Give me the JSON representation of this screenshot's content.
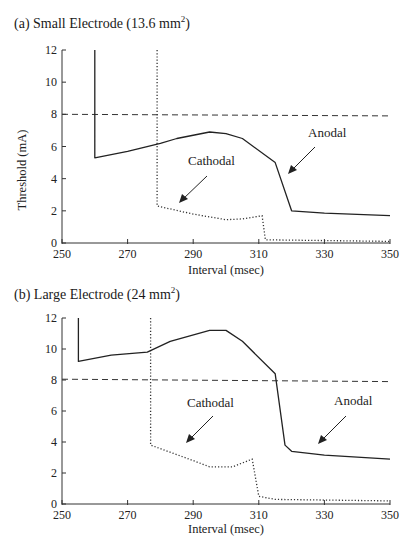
{
  "panels": [
    {
      "id": "a",
      "title_prefix": "(a) Small Electrode (13.6 mm",
      "title_sup": "2",
      "title_suffix": ")",
      "ylabel": "Threshold (mA)",
      "xlabel": "Interval (msec)",
      "x_ticks": [
        "250",
        "270",
        "290",
        "310",
        "330",
        "350"
      ],
      "y_ticks": [
        "0",
        "2",
        "4",
        "6",
        "8",
        "10",
        "12"
      ],
      "annotations": {
        "cathodal": "Cathodal",
        "anodal": "Anodal"
      }
    },
    {
      "id": "b",
      "title_prefix": "(b) Large Electrode (24 mm",
      "title_sup": "2",
      "title_suffix": ")",
      "ylabel": "Threshold (mA)",
      "xlabel": "Interval (msec)",
      "x_ticks": [
        "250",
        "270",
        "290",
        "310",
        "330",
        "350"
      ],
      "y_ticks": [
        "0",
        "2",
        "4",
        "6",
        "8",
        "10",
        "12"
      ],
      "annotations": {
        "cathodal": "Cathodal",
        "anodal": "Anodal"
      }
    }
  ],
  "chart_data": [
    {
      "type": "line",
      "title": "(a) Small Electrode (13.6 mm²)",
      "xlabel": "Interval (msec)",
      "ylabel": "Threshold (mA)",
      "xlim": [
        250,
        350
      ],
      "ylim": [
        0,
        12
      ],
      "x_ticks": [
        250,
        270,
        290,
        310,
        330,
        350
      ],
      "y_ticks": [
        0,
        2,
        4,
        6,
        8,
        10,
        12
      ],
      "grid": false,
      "legend": "none (inline annotations with arrows)",
      "series": [
        {
          "name": "Anodal",
          "style": "solid",
          "x": [
            260,
            260,
            270,
            280,
            285,
            295,
            300,
            305,
            315,
            320,
            330,
            350
          ],
          "y": [
            12,
            5.3,
            5.7,
            6.2,
            6.5,
            6.9,
            6.8,
            6.5,
            5.0,
            2.0,
            1.85,
            1.7
          ]
        },
        {
          "name": "Cathodal",
          "style": "dotted",
          "x": [
            279,
            279,
            290,
            300,
            305,
            311,
            312,
            350
          ],
          "y": [
            12,
            2.3,
            1.8,
            1.45,
            1.5,
            1.7,
            0.2,
            0.1
          ]
        },
        {
          "name": "Reference (8 mA)",
          "style": "dashed",
          "x": [
            250,
            350
          ],
          "y": [
            8,
            7.9
          ]
        }
      ],
      "annotations": [
        "Cathodal",
        "Anodal"
      ]
    },
    {
      "type": "line",
      "title": "(b) Large Electrode (24 mm²)",
      "xlabel": "Interval (msec)",
      "ylabel": "",
      "xlim": [
        250,
        350
      ],
      "ylim": [
        0,
        12
      ],
      "x_ticks": [
        250,
        270,
        290,
        310,
        330,
        350
      ],
      "y_ticks": [
        0,
        2,
        4,
        6,
        8,
        10,
        12
      ],
      "grid": false,
      "legend": "none (inline annotations with arrows)",
      "series": [
        {
          "name": "Anodal",
          "style": "solid",
          "x": [
            255,
            255,
            265,
            276,
            283,
            295,
            300,
            305,
            315,
            318,
            320,
            330,
            350
          ],
          "y": [
            12,
            9.2,
            9.6,
            9.8,
            10.5,
            11.2,
            11.2,
            10.5,
            8.4,
            3.8,
            3.4,
            3.15,
            2.9
          ]
        },
        {
          "name": "Cathodal",
          "style": "dotted",
          "x": [
            277,
            277,
            290,
            295,
            302,
            308,
            310,
            315,
            350
          ],
          "y": [
            12,
            3.8,
            2.8,
            2.4,
            2.4,
            2.9,
            0.5,
            0.3,
            0.2
          ]
        },
        {
          "name": "Reference (8 mA)",
          "style": "dashed",
          "x": [
            250,
            350
          ],
          "y": [
            8.05,
            7.9
          ]
        }
      ],
      "annotations": [
        "Cathodal",
        "Anodal"
      ]
    }
  ]
}
